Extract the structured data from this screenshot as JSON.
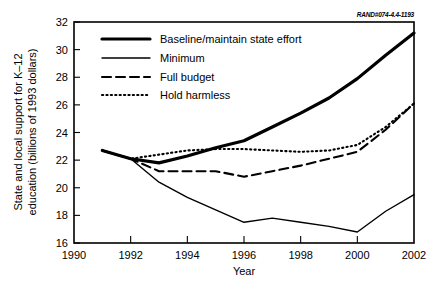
{
  "credit": {
    "text": "RAND#074-4.4-1193"
  },
  "chart_data": {
    "type": "line",
    "title": "",
    "xlabel": "Year",
    "ylabel": "State and local support for K–12 education (billions of 1993 dollars)",
    "ylabel_line1": "State and local support for K–12",
    "ylabel_line2": "education (billions of 1993 dollars)",
    "xlim": [
      1990,
      2002
    ],
    "ylim": [
      16,
      32
    ],
    "xticks": [
      1990,
      1992,
      1994,
      1996,
      1998,
      2000,
      2002
    ],
    "xtick_labels": [
      "1990",
      "1992",
      "1994",
      "1996",
      "1998",
      "2000",
      "2002"
    ],
    "yticks": [
      16,
      18,
      20,
      22,
      24,
      26,
      28,
      30,
      32
    ],
    "ytick_labels": [
      "16",
      "18",
      "20",
      "22",
      "24",
      "26",
      "28",
      "30",
      "32"
    ],
    "grid": false,
    "legend_position": "upper-left-inside",
    "x": [
      1991,
      1992,
      1993,
      1994,
      1995,
      1996,
      1997,
      1998,
      1999,
      2000,
      2001,
      2002
    ],
    "series": [
      {
        "name": "Baseline/maintain state effort",
        "style": "thick-solid",
        "color": "#000000",
        "values": [
          22.7,
          22.1,
          21.8,
          22.3,
          22.9,
          23.4,
          24.4,
          25.4,
          26.5,
          27.9,
          29.6,
          31.2
        ]
      },
      {
        "name": "Minimum",
        "style": "thin-solid",
        "color": "#000000",
        "values": [
          22.7,
          22.1,
          20.4,
          19.3,
          18.4,
          17.5,
          17.8,
          17.5,
          17.2,
          16.8,
          18.3,
          19.5
        ]
      },
      {
        "name": "Full budget",
        "style": "dashed",
        "color": "#000000",
        "values": [
          22.7,
          22.1,
          21.2,
          21.2,
          21.2,
          20.8,
          21.2,
          21.6,
          22.1,
          22.6,
          24.2,
          26.1
        ]
      },
      {
        "name": "Hold harmless",
        "style": "dotted",
        "color": "#000000",
        "values": [
          22.7,
          22.1,
          22.4,
          22.7,
          22.8,
          22.8,
          22.7,
          22.6,
          22.7,
          23.1,
          24.4,
          26.1
        ]
      }
    ],
    "legend": [
      {
        "label": "Baseline/maintain state effort",
        "style": "thick-solid"
      },
      {
        "label": "Minimum",
        "style": "thin-solid"
      },
      {
        "label": "Full budget",
        "style": "dashed"
      },
      {
        "label": "Hold harmless",
        "style": "dotted"
      }
    ]
  }
}
